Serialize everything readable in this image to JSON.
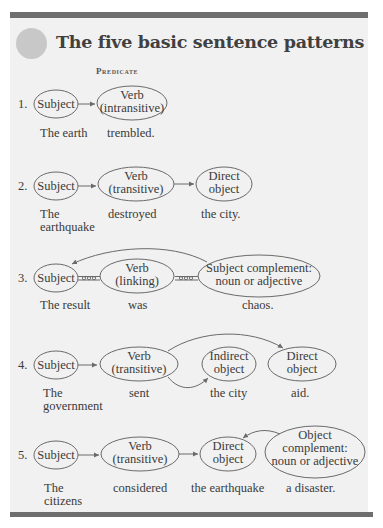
{
  "title": "The five basic sentence patterns",
  "predicate_heading": "Predicate",
  "colors": {
    "bar": "#6e6e6e",
    "panel": "#f1f1f1",
    "badge": "#c8c8c8",
    "stroke": "#6a6a6a",
    "text": "#3a3a3a"
  },
  "patterns": [
    {
      "number": "1.",
      "nodes": [
        {
          "lines": [
            "Subject"
          ],
          "example": [
            "The earth"
          ]
        },
        {
          "lines": [
            "Verb",
            "(intransitive)"
          ],
          "example": [
            "trembled."
          ]
        }
      ]
    },
    {
      "number": "2.",
      "nodes": [
        {
          "lines": [
            "Subject"
          ],
          "example": [
            "The",
            "earthquake"
          ]
        },
        {
          "lines": [
            "Verb",
            "(transitive)"
          ],
          "example": [
            "destroyed"
          ]
        },
        {
          "lines": [
            "Direct",
            "object"
          ],
          "example": [
            "the city."
          ]
        }
      ]
    },
    {
      "number": "3.",
      "nodes": [
        {
          "lines": [
            "Subject"
          ],
          "example": [
            "The result"
          ]
        },
        {
          "lines": [
            "Verb",
            "(linking)"
          ],
          "example": [
            "was"
          ]
        },
        {
          "lines": [
            "Subject complement:",
            "noun or adjective"
          ],
          "example": [
            "chaos."
          ]
        }
      ]
    },
    {
      "number": "4.",
      "nodes": [
        {
          "lines": [
            "Subject"
          ],
          "example": [
            "The",
            "government"
          ]
        },
        {
          "lines": [
            "Verb",
            "(transitive)"
          ],
          "example": [
            "sent"
          ]
        },
        {
          "lines": [
            "Indirect",
            "object"
          ],
          "example": [
            "the city"
          ]
        },
        {
          "lines": [
            "Direct",
            "object"
          ],
          "example": [
            "aid."
          ]
        }
      ]
    },
    {
      "number": "5.",
      "nodes": [
        {
          "lines": [
            "Subject"
          ],
          "example": [
            "The",
            "citizens"
          ]
        },
        {
          "lines": [
            "Verb",
            "(transitive)"
          ],
          "example": [
            "considered"
          ]
        },
        {
          "lines": [
            "Direct",
            "object"
          ],
          "example": [
            "the earthquake"
          ]
        },
        {
          "lines": [
            "Object",
            "complement:",
            "noun or adjective"
          ],
          "example": [
            "a disaster."
          ]
        }
      ]
    }
  ]
}
